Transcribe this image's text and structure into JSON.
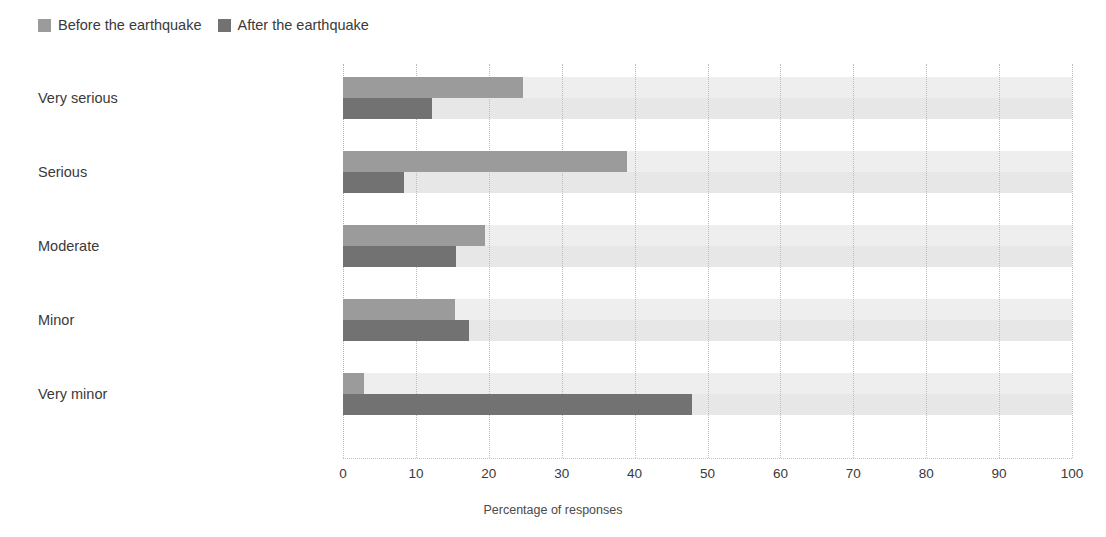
{
  "legend": {
    "position": "top-left",
    "items": [
      {
        "label": "Before the earthquake",
        "color": "#9b9b9b",
        "swatch": "legend-swatch-before"
      },
      {
        "label": "After the earthquake",
        "color": "#727272",
        "swatch": "legend-swatch-after"
      }
    ]
  },
  "chart_data": {
    "type": "bar",
    "orientation": "horizontal",
    "title": "",
    "subtitle": "",
    "xlabel": "Percentage of responses",
    "ylabel": "",
    "xlim": [
      0,
      100
    ],
    "xticks": [
      0,
      10,
      20,
      30,
      40,
      50,
      60,
      70,
      80,
      90,
      100
    ],
    "xtick_labels": [
      "0",
      "10",
      "20",
      "30",
      "40",
      "50",
      "60",
      "70",
      "80",
      "90",
      "100"
    ],
    "grid": "vertical-dotted",
    "categories": [
      "Very serious",
      "Serious",
      "Moderate",
      "Minor",
      "Very minor"
    ],
    "series": [
      {
        "name": "Before the earthquake",
        "color": "#9b9b9b",
        "values": [
          24.7,
          39.0,
          19.5,
          15.4,
          2.9
        ]
      },
      {
        "name": "After the earthquake",
        "color": "#727272",
        "values": [
          12.2,
          8.4,
          15.5,
          17.3,
          47.9
        ]
      }
    ],
    "band_colors": [
      "#eeeeee",
      "#e7e7e7"
    ],
    "legend_position": "top-left"
  },
  "axis": {
    "x_title": "Percentage of responses"
  }
}
